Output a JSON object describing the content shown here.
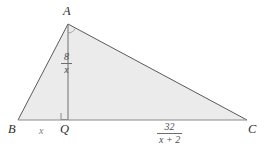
{
  "figure": {
    "kind": "geometry-diagram",
    "colors": {
      "background": "#ffffff",
      "triangle_fill": "#ebebeb",
      "outline": "#555555",
      "altitude_line": "#707070",
      "baseline": "#8a8a8a",
      "label_dark": "#2e2e2e",
      "label_gray": "#7a7a7a"
    },
    "vertices": {
      "A": {
        "label": "A",
        "x": 68,
        "y": 24
      },
      "B": {
        "label": "B",
        "x": 18,
        "y": 120
      },
      "C": {
        "label": "C",
        "x": 247,
        "y": 120
      },
      "Q": {
        "label": "Q",
        "x": 68,
        "y": 120
      }
    },
    "segments": {
      "BQ": {
        "label": "x"
      },
      "AQ": {
        "numerator": "8",
        "denominator": "x"
      },
      "QC": {
        "numerator": "32",
        "denominator": "x + 2"
      }
    },
    "marks": {
      "right_angle_at_Q": "right-angle-square",
      "angle_arc_at_A": "angle-arc"
    }
  }
}
